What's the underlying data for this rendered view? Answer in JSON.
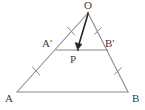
{
  "figure": {
    "type": "geometry-diagram",
    "background_color": "#ffffff",
    "stroke_color": "#8a8a8a",
    "arrow_color": "#262626",
    "label_color": "#3a3a3a",
    "points": [
      {
        "id": "O",
        "label": "O",
        "x": 88,
        "y": 13,
        "label_x": 84,
        "label_y": 0
      },
      {
        "id": "A",
        "label": "A",
        "x": 17,
        "y": 92,
        "label_x": 5,
        "label_y": 93
      },
      {
        "id": "B",
        "label": "B",
        "x": 128,
        "y": 92,
        "label_x": 132,
        "label_y": 93
      },
      {
        "id": "Ap",
        "label": "A'",
        "x": 56,
        "y": 50,
        "label_x": 42,
        "label_y": 38
      },
      {
        "id": "Bp",
        "label": "B'",
        "x": 108,
        "y": 50,
        "label_x": 105,
        "label_y": 38
      },
      {
        "id": "P",
        "label": "P",
        "x": 78,
        "y": 50,
        "label_x": 70,
        "label_y": 54
      }
    ],
    "segments": [
      {
        "id": "O-A",
        "from": "O",
        "to": "A",
        "kind": "triangle-side"
      },
      {
        "id": "O-B",
        "from": "O",
        "to": "B",
        "kind": "triangle-side"
      },
      {
        "id": "A-B",
        "from": "A",
        "to": "B",
        "kind": "triangle-base"
      },
      {
        "id": "Ap-Bp",
        "from": "Ap",
        "to": "Bp",
        "kind": "midsegment"
      }
    ],
    "vectors": [
      {
        "id": "O-P",
        "from": "O",
        "to": "P",
        "arrowhead": true
      }
    ],
    "tick_marks": [
      {
        "id": "tick-O-Ap",
        "on": "O-A",
        "x": 71,
        "y": 31,
        "angle": 48,
        "count": 1
      },
      {
        "id": "tick-Ap-A",
        "on": "O-A",
        "x": 36,
        "y": 71,
        "angle": 48,
        "count": 1
      },
      {
        "id": "tick-O-Bp",
        "on": "O-B",
        "x": 98,
        "y": 31,
        "angle": -61,
        "count": 1
      },
      {
        "id": "tick-Bp-B",
        "on": "O-B",
        "x": 118,
        "y": 71,
        "angle": -61,
        "count": 1
      }
    ]
  }
}
